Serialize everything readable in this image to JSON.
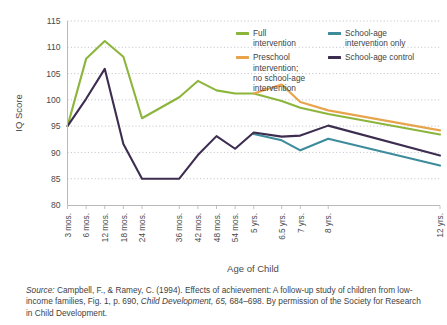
{
  "chart_data": {
    "type": "line",
    "title": "",
    "xlabel": "Age of Child",
    "ylabel": "IQ Score",
    "ylim": [
      80,
      115
    ],
    "yticks": [
      80,
      85,
      90,
      95,
      100,
      105,
      110,
      115
    ],
    "grid": true,
    "legend_position": "top-right",
    "categories": [
      "3 mos.",
      "6 mos.",
      "12 mos.",
      "18 mos.",
      "24 mos.",
      "36 mos.",
      "42 mos.",
      "48 mos.",
      "54 mos.",
      "5 yrs.",
      "6.5 yrs.",
      "7 yrs.",
      "8 yrs.",
      "12 yrs."
    ],
    "x_positions": [
      0,
      1,
      2,
      3,
      4,
      6,
      7,
      8,
      9,
      10,
      11.5,
      12.5,
      14,
      20
    ],
    "series": [
      {
        "name": "Full intervention",
        "color": "#8CB53C",
        "values": [
          95,
          107.8,
          111.2,
          108.2,
          96.5,
          100.5,
          103.6,
          101.8,
          101.2,
          101.2,
          99.8,
          98.5,
          97.3,
          93.4
        ]
      },
      {
        "name": "Preschool intervention; no school-age intervention",
        "color": "#E8A44C",
        "values": [
          null,
          null,
          null,
          null,
          null,
          null,
          null,
          null,
          null,
          101.2,
          102.9,
          99.6,
          98.0,
          94.2
        ]
      },
      {
        "name": "School-age intervention only",
        "color": "#3C8C9C",
        "values": [
          null,
          null,
          null,
          null,
          null,
          null,
          null,
          null,
          null,
          93.5,
          92.3,
          90.4,
          92.6,
          87.5
        ]
      },
      {
        "name": "School-age control",
        "color": "#3D2D50",
        "values": [
          95,
          100.2,
          105.9,
          91.6,
          85,
          85,
          89.5,
          93.1,
          90.7,
          93.8,
          93.0,
          93.2,
          95.1,
          89.4
        ]
      }
    ]
  },
  "legend": {
    "items": [
      {
        "label": "Full\nintervention",
        "color": "#8CB53C",
        "column": "a"
      },
      {
        "label": "Preschool\nintervention;\nno school-age\nintervention",
        "color": "#E8A44C",
        "column": "a"
      },
      {
        "label": "School-age\nintervention only",
        "color": "#3C8C9C",
        "column": "b"
      },
      {
        "label": "School-age control",
        "color": "#3D2D50",
        "column": "b"
      }
    ]
  },
  "source_note": {
    "prefix": "Source:",
    "part1": " Campbell, F., & Ramey, C. (1994). Effects of achievement: A follow-up study of children from low-income families, Fig. 1, p. 690, ",
    "journal": "Child Development, 65,",
    "part2": " 684–698. By permission of the Society for Research in Child Development."
  }
}
